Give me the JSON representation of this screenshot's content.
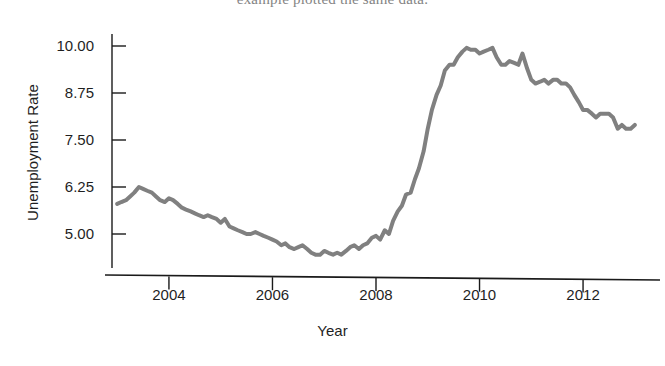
{
  "page": {
    "bleed_text": "example plotted the same data.",
    "background_color": "#ffffff"
  },
  "figure": {
    "name": "unemployment-rate-time-series"
  },
  "chart_data": {
    "type": "line",
    "title": "",
    "subtitle": "",
    "xlabel": "Year",
    "ylabel": "Unemployment Rate",
    "grid": false,
    "legend": false,
    "legend_position": "none",
    "line_color": "#808080",
    "line_width": 4,
    "axis_color": "#1a1a1a",
    "xlim": [
      2002.9,
      2013.1
    ],
    "ylim": [
      4.15,
      10.25
    ],
    "xticks": [
      2004,
      2006,
      2008,
      2010,
      2012
    ],
    "xtick_labels": [
      "2004",
      "2006",
      "2008",
      "2010",
      "2012"
    ],
    "yticks": [
      5.0,
      6.25,
      7.5,
      8.75,
      10.0
    ],
    "ytick_labels": [
      "5.00",
      "6.25",
      "7.50",
      "8.75",
      "10.00"
    ],
    "series": [
      {
        "name": "Unemployment Rate",
        "x": [
          2003.0,
          2003.08,
          2003.17,
          2003.25,
          2003.33,
          2003.42,
          2003.5,
          2003.58,
          2003.67,
          2003.75,
          2003.83,
          2003.92,
          2004.0,
          2004.08,
          2004.17,
          2004.25,
          2004.33,
          2004.42,
          2004.5,
          2004.58,
          2004.67,
          2004.75,
          2004.83,
          2004.92,
          2005.0,
          2005.08,
          2005.17,
          2005.25,
          2005.33,
          2005.42,
          2005.5,
          2005.58,
          2005.67,
          2005.75,
          2005.83,
          2005.92,
          2006.0,
          2006.08,
          2006.17,
          2006.25,
          2006.33,
          2006.42,
          2006.5,
          2006.58,
          2006.67,
          2006.75,
          2006.83,
          2006.92,
          2007.0,
          2007.08,
          2007.17,
          2007.25,
          2007.33,
          2007.42,
          2007.5,
          2007.58,
          2007.67,
          2007.75,
          2007.83,
          2007.92,
          2008.0,
          2008.08,
          2008.17,
          2008.25,
          2008.33,
          2008.42,
          2008.5,
          2008.58,
          2008.67,
          2008.75,
          2008.83,
          2008.92,
          2009.0,
          2009.08,
          2009.17,
          2009.25,
          2009.33,
          2009.42,
          2009.5,
          2009.58,
          2009.67,
          2009.75,
          2009.83,
          2009.92,
          2010.0,
          2010.08,
          2010.17,
          2010.25,
          2010.33,
          2010.42,
          2010.5,
          2010.58,
          2010.67,
          2010.75,
          2010.83,
          2010.92,
          2011.0,
          2011.08,
          2011.17,
          2011.25,
          2011.33,
          2011.42,
          2011.5,
          2011.58,
          2011.67,
          2011.75,
          2011.83,
          2011.92,
          2012.0,
          2012.08,
          2012.17,
          2012.25,
          2012.33,
          2012.42,
          2012.5,
          2012.58,
          2012.67,
          2012.75,
          2012.83,
          2012.92,
          2013.0
        ],
        "y": [
          5.8,
          5.85,
          5.9,
          6.0,
          6.1,
          6.25,
          6.2,
          6.15,
          6.1,
          6.0,
          5.9,
          5.85,
          5.95,
          5.9,
          5.8,
          5.7,
          5.65,
          5.6,
          5.55,
          5.5,
          5.45,
          5.5,
          5.45,
          5.4,
          5.3,
          5.4,
          5.2,
          5.15,
          5.1,
          5.05,
          5.0,
          5.0,
          5.05,
          5.0,
          4.95,
          4.9,
          4.85,
          4.8,
          4.7,
          4.75,
          4.65,
          4.6,
          4.65,
          4.7,
          4.6,
          4.5,
          4.45,
          4.45,
          4.55,
          4.5,
          4.45,
          4.5,
          4.45,
          4.55,
          4.65,
          4.7,
          4.6,
          4.7,
          4.75,
          4.9,
          4.95,
          4.85,
          5.1,
          5.0,
          5.35,
          5.6,
          5.75,
          6.05,
          6.1,
          6.45,
          6.75,
          7.2,
          7.8,
          8.3,
          8.7,
          8.95,
          9.35,
          9.5,
          9.5,
          9.7,
          9.85,
          9.95,
          9.9,
          9.9,
          9.8,
          9.85,
          9.9,
          9.95,
          9.7,
          9.5,
          9.5,
          9.6,
          9.55,
          9.5,
          9.8,
          9.4,
          9.1,
          9.0,
          9.05,
          9.1,
          9.0,
          9.1,
          9.1,
          9.0,
          9.0,
          8.9,
          8.7,
          8.5,
          8.3,
          8.3,
          8.2,
          8.1,
          8.2,
          8.2,
          8.2,
          8.1,
          7.8,
          7.9,
          7.8,
          7.8,
          7.9
        ]
      }
    ],
    "annotations": {
      "start_value": 5.8,
      "peak_value": 9.95,
      "peak_year": 2010,
      "trough_value": 4.45,
      "trough_year": 2007,
      "end_value": 7.9
    }
  }
}
